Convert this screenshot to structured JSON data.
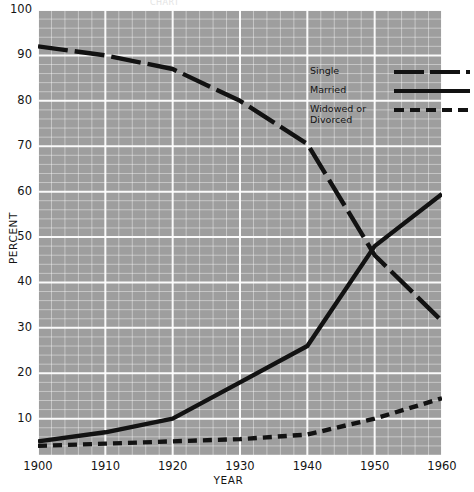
{
  "title_fragment": "CHART",
  "axes": {
    "xlabel": "YEAR",
    "ylabel": "PERCENT",
    "yticks": [
      "100",
      "90",
      "80",
      "70",
      "60",
      "50",
      "40",
      "30",
      "20",
      "10"
    ],
    "xticks": [
      "1900",
      "1910",
      "1920",
      "1930",
      "1940",
      "1950",
      "1960"
    ]
  },
  "legend": {
    "items": [
      {
        "label": "Single",
        "style": "long-dash"
      },
      {
        "label": "Married",
        "style": "solid"
      },
      {
        "label": "Widowed or\nDivorced",
        "style": "short-dash"
      }
    ]
  },
  "chart_data": {
    "type": "line",
    "title": "",
    "xlabel": "YEAR",
    "ylabel": "PERCENT",
    "xlim": [
      1900,
      1960
    ],
    "ylim": [
      2,
      100
    ],
    "xticks": [
      1900,
      1910,
      1920,
      1930,
      1940,
      1950,
      1960
    ],
    "yticks": [
      10,
      20,
      30,
      40,
      50,
      60,
      70,
      80,
      90,
      100
    ],
    "grid": true,
    "minor_grid": {
      "x_step": 2,
      "y_step": 2
    },
    "legend_position": "upper-right-inside",
    "background": "#9e9e9e",
    "line_color": "#121212",
    "x": [
      1900,
      1910,
      1920,
      1930,
      1940,
      1950,
      1960
    ],
    "series": [
      {
        "name": "Single",
        "style": "long-dash",
        "values": [
          92,
          90,
          87,
          80,
          70.5,
          46,
          31.5
        ]
      },
      {
        "name": "Married",
        "style": "solid",
        "values": [
          5,
          7,
          10,
          18,
          26,
          48,
          59.5
        ]
      },
      {
        "name": "Widowed or Divorced",
        "style": "short-dash",
        "values": [
          4,
          4.5,
          5,
          5.5,
          6.5,
          10,
          14.5
        ]
      }
    ]
  }
}
